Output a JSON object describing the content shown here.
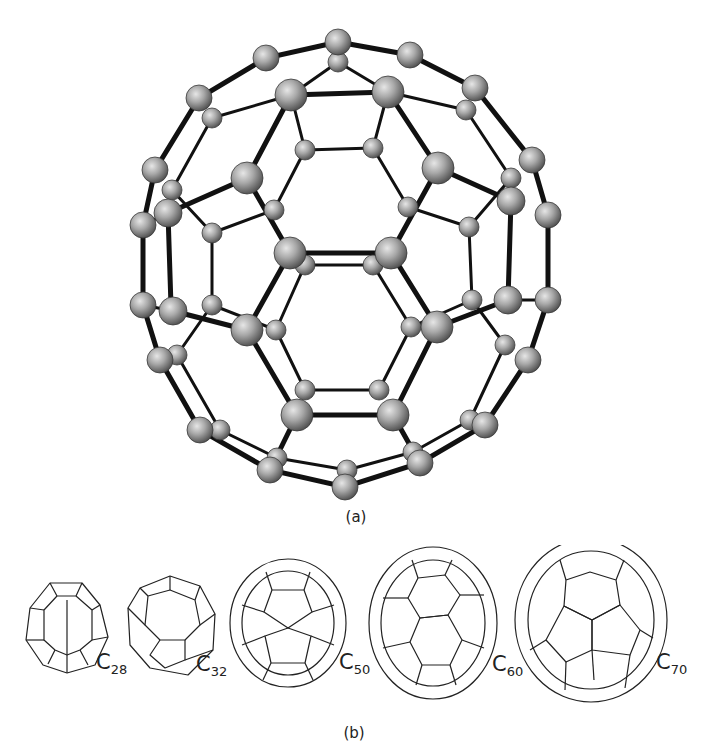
{
  "figure": {
    "panel_a": {
      "label": "(a)",
      "subject": "C60 buckminsterfullerene ball-and-stick model",
      "atom_color": "#9a9a9a",
      "bond_color": "#111111"
    },
    "panel_b": {
      "label": "(b)",
      "cages": [
        {
          "formula": "C",
          "subscript": "28"
        },
        {
          "formula": "C",
          "subscript": "32"
        },
        {
          "formula": "C",
          "subscript": "50"
        },
        {
          "formula": "C",
          "subscript": "60"
        },
        {
          "formula": "C",
          "subscript": "70"
        }
      ]
    }
  }
}
